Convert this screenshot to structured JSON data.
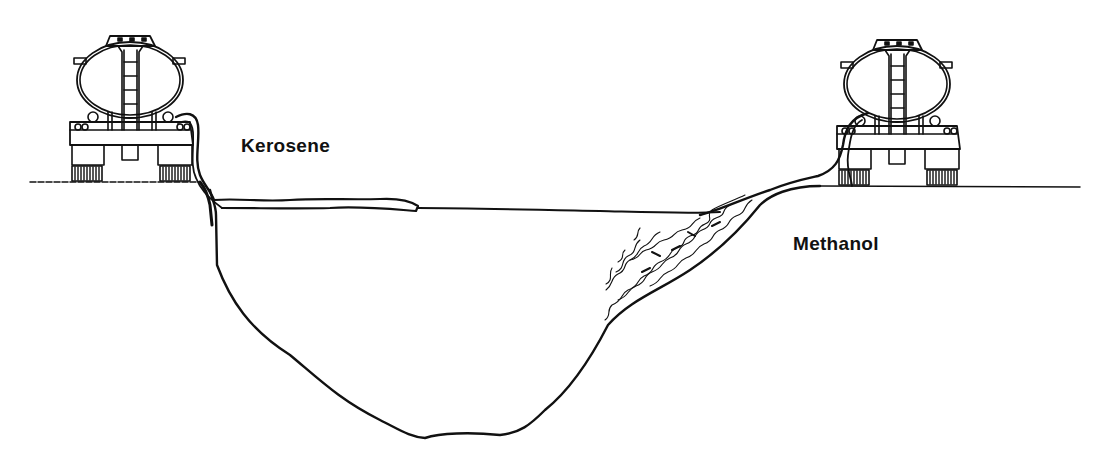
{
  "diagram": {
    "type": "illustration",
    "labels": {
      "kerosene": "Kerosene",
      "methanol": "Methanol"
    },
    "elements": [
      {
        "id": "left-tanker",
        "kind": "tanker truck rear view",
        "discharge": "Kerosene"
      },
      {
        "id": "right-tanker",
        "kind": "tanker truck rear view",
        "discharge": "Methanol"
      },
      {
        "id": "pit",
        "kind": "excavated pit / water body cross-section"
      },
      {
        "id": "kerosene-layer",
        "kind": "floating layer on surface",
        "behavior": "spreads on top of water"
      },
      {
        "id": "methanol-plume",
        "kind": "mixing plume",
        "behavior": "mixes/dissolves into water along slope"
      }
    ],
    "colors": {
      "line": "#111111",
      "background": "#ffffff"
    }
  }
}
